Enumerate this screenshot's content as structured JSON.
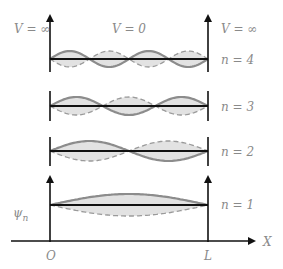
{
  "diagram": {
    "labels": {
      "left_potential": "V = ∞",
      "center_potential": "V = 0",
      "right_potential": "V = ∞",
      "psi": "ψ",
      "psi_sub": "n",
      "origin": "O",
      "well_end": "L",
      "x_axis": "X"
    },
    "levels": [
      {
        "n": 4,
        "label": "n = 4",
        "axis_y": 59,
        "amp": 8
      },
      {
        "n": 3,
        "label": "n = 3",
        "axis_y": 106,
        "amp": 9
      },
      {
        "n": 2,
        "label": "n = 2",
        "axis_y": 151,
        "amp": 10
      },
      {
        "n": 1,
        "label": "n = 1",
        "axis_y": 205,
        "amp": 11
      }
    ],
    "colors": {
      "axis": "#111111",
      "solid_wave": "#8c8c8c",
      "dashed_wave": "#9a9a9a",
      "fill": "#e2e2e2",
      "text": "#8a8a8a"
    }
  }
}
